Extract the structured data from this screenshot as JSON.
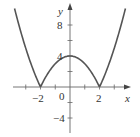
{
  "chart_data": {
    "type": "line",
    "title": "",
    "function": "y = |x^2 - 4|",
    "xlabel": "x",
    "ylabel": "y",
    "xlim": [
      -4.7,
      4.7
    ],
    "ylim": [
      -5.9,
      11.2
    ],
    "x_ticks": [
      -3,
      -2,
      -1,
      1,
      2,
      3
    ],
    "x_tick_labels": [
      {
        "value": -2,
        "label": "−2"
      },
      {
        "value": 0,
        "label": "0"
      },
      {
        "value": 2,
        "label": "2"
      }
    ],
    "y_ticks": [
      -4,
      -2,
      2,
      4,
      6,
      8
    ],
    "y_tick_labels": [
      {
        "value": 8,
        "label": "8"
      },
      {
        "value": 4,
        "label": "4"
      },
      {
        "value": -4,
        "label": "−4"
      }
    ],
    "grid": false,
    "legend": null,
    "series": [
      {
        "name": "|x^2 - 4|",
        "x": [
          -3.76,
          -3.5,
          -3,
          -2.5,
          -2,
          -1.5,
          -1,
          -0.5,
          0,
          0.5,
          1,
          1.5,
          2,
          2.5,
          3,
          3.5,
          3.76
        ],
        "y": [
          10.14,
          8.25,
          5,
          2.25,
          0,
          1.75,
          3,
          3.75,
          4,
          3.75,
          3,
          1.75,
          0,
          2.25,
          5,
          8.25,
          10.14
        ]
      }
    ],
    "colors": {
      "curve": "#555555",
      "axis": "#555555",
      "text": "#333333"
    }
  }
}
